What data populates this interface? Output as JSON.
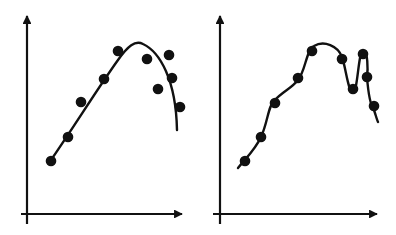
{
  "colors": {
    "ink": "#111111",
    "background": "#ffffff"
  },
  "panels": [
    {
      "name": "left",
      "caption": "smooth fit (underfit)",
      "y_axis": {
        "x": 27,
        "top": 14,
        "bottom": 224
      },
      "x_axis": {
        "y": 214,
        "left": 21,
        "right": 184
      },
      "points": [
        [
          51,
          161
        ],
        [
          68,
          137
        ],
        [
          81,
          102
        ],
        [
          104,
          79
        ],
        [
          118,
          51
        ],
        [
          147,
          59
        ],
        [
          169,
          55
        ],
        [
          172,
          78
        ],
        [
          158,
          89
        ],
        [
          180,
          107
        ]
      ],
      "curve": "M51,160 C75,125 100,85 118,60 C128,46 135,40 143,44 C160,52 176,80 177,130"
    },
    {
      "name": "right",
      "caption": "wiggly fit (overfit)",
      "y_axis": {
        "x": 220,
        "top": 14,
        "bottom": 224
      },
      "x_axis": {
        "y": 214,
        "left": 213,
        "right": 379
      },
      "points": [
        [
          245,
          161
        ],
        [
          261,
          137
        ],
        [
          275,
          103
        ],
        [
          298,
          78
        ],
        [
          312,
          51
        ],
        [
          342,
          59
        ],
        [
          353,
          89
        ],
        [
          363,
          54
        ],
        [
          367,
          77
        ],
        [
          374,
          106
        ]
      ],
      "curve": "M238,168 C246,158 255,150 261,137 C268,122 268,105 275,100 C282,92 292,88 298,80 C306,70 306,50 314,46 C324,40 338,46 342,57 C346,68 348,92 353,92 C358,92 358,52 363,51 C368,50 368,70 367,77 C368,90 370,105 374,110 C376,116 377,120 378,122"
    }
  ]
}
